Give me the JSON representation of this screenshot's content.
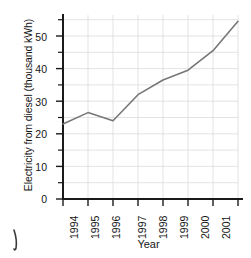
{
  "chart_data": {
    "type": "line",
    "title": "",
    "xlabel": "Year",
    "ylabel": "Electricity from diesel (thousand kWh)",
    "categories": [
      "1994",
      "1995",
      "1996",
      "1997",
      "1998",
      "1999",
      "2000",
      "2001"
    ],
    "values": [
      23,
      26.5,
      24,
      32,
      36.5,
      39.5,
      45.5,
      54.5
    ],
    "series": [
      {
        "name": "Electricity from diesel",
        "values": [
          23,
          26.5,
          24,
          32,
          36.5,
          39.5,
          45.5,
          54.5
        ]
      }
    ],
    "ylim": [
      0,
      56
    ],
    "y_ticks": [
      0,
      10,
      20,
      30,
      40,
      50
    ],
    "y_tick_labels": [
      "0",
      "10",
      "20",
      "30",
      "40",
      "50"
    ],
    "y_minor_ticks": [
      5,
      15,
      25,
      35,
      45,
      55
    ],
    "x_tick_labels": [
      "1994",
      "1995",
      "1996",
      "1997",
      "1998",
      "1999",
      "2000",
      "2001"
    ],
    "grid": true,
    "legend": "none",
    "line_color": "#707070",
    "axis_color": "#1a1a1a",
    "grid_color": "#d8d8d8"
  },
  "axes": {
    "y_title": "Electricity from diesel (thousand kWh)",
    "x_title": "Year"
  }
}
